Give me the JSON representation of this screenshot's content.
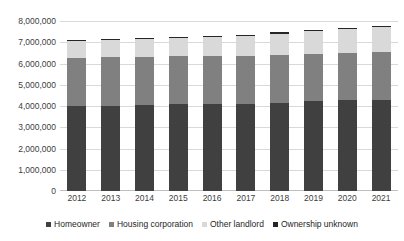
{
  "chart_data": {
    "type": "bar",
    "stacked": true,
    "title": "",
    "xlabel": "",
    "ylabel": "",
    "ylim": [
      0,
      8000000
    ],
    "ytick_step": 1000000,
    "grid": true,
    "legend_position": "bottom",
    "categories": [
      "2012",
      "2013",
      "2014",
      "2015",
      "2016",
      "2017",
      "2018",
      "2019",
      "2020",
      "2021"
    ],
    "ytick_labels": [
      "8,000,000",
      "7,000,000",
      "6,000,000",
      "5,000,000",
      "4,000,000",
      "3,000,000",
      "2,000,000",
      "1,000,000",
      "0"
    ],
    "series": [
      {
        "name": "Homeowner",
        "color": "#404040",
        "values": [
          3980000,
          4010000,
          4040000,
          4080000,
          4100000,
          4110000,
          4160000,
          4220000,
          4260000,
          4290000
        ]
      },
      {
        "name": "Housing corporation",
        "color": "#808080",
        "values": [
          2300000,
          2290000,
          2280000,
          2270000,
          2260000,
          2250000,
          2250000,
          2250000,
          2250000,
          2250000
        ]
      },
      {
        "name": "Other landlord",
        "color": "#d9d9d9",
        "values": [
          760000,
          790000,
          820000,
          860000,
          900000,
          950000,
          1000000,
          1060000,
          1120000,
          1190000
        ]
      },
      {
        "name": "Ownership unknown",
        "color": "#262626",
        "values": [
          60000,
          60000,
          60000,
          50000,
          50000,
          50000,
          50000,
          50000,
          50000,
          50000
        ]
      }
    ],
    "totals": [
      7100000,
      7150000,
      7200000,
      7260000,
      7310000,
      7360000,
      7460000,
      7580000,
      7680000,
      7780000
    ]
  }
}
